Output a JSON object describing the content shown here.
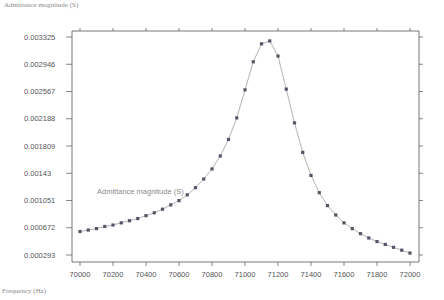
{
  "chart_data": {
    "type": "line",
    "title": "",
    "xlabel": "Frequency (Hz)",
    "ylabel": "Admittance magnitude (S)",
    "xlim": [
      70000,
      72000
    ],
    "ylim": [
      0.000293,
      0.003325
    ],
    "x_ticks": [
      70000,
      70200,
      70400,
      70600,
      70800,
      71000,
      71200,
      71400,
      71600,
      71800,
      72000
    ],
    "y_ticks": [
      "0.003325",
      "0.002946",
      "0.002567",
      "0.002188",
      "0.001809",
      "0.00143",
      "0.001051",
      "0.000672",
      "0.000293"
    ],
    "grid": false,
    "legend": {
      "position": "inline",
      "entries": [
        "Admittance magnitude (S)"
      ]
    },
    "series": [
      {
        "name": "Admittance magnitude (S)",
        "marker": "square",
        "x": [
          70000,
          70050,
          70100,
          70150,
          70200,
          70250,
          70300,
          70350,
          70400,
          70450,
          70500,
          70550,
          70600,
          70650,
          70700,
          70750,
          70800,
          70850,
          70900,
          70950,
          71000,
          71050,
          71100,
          71150,
          71200,
          71250,
          71300,
          71350,
          71400,
          71450,
          71500,
          71550,
          71600,
          71650,
          71700,
          71750,
          71800,
          71850,
          71900,
          71950,
          72000
        ],
        "y": [
          0.00062,
          0.00064,
          0.00066,
          0.00069,
          0.00071,
          0.00074,
          0.00077,
          0.0008,
          0.00084,
          0.00088,
          0.00093,
          0.00099,
          0.00105,
          0.00113,
          0.00123,
          0.00135,
          0.00149,
          0.00167,
          0.0019,
          0.0022,
          0.00259,
          0.00298,
          0.00323,
          0.00327,
          0.00306,
          0.0026,
          0.00213,
          0.00172,
          0.0014,
          0.00116,
          0.00098,
          0.00085,
          0.00074,
          0.00066,
          0.00059,
          0.00053,
          0.00048,
          0.00044,
          0.0004,
          0.00036,
          0.00032
        ]
      }
    ]
  },
  "labels": {
    "y_axis_title": "Admittance magnitude (S)",
    "x_axis_title": "Frequency (Hz)",
    "series_label": "Admittance magnitude (S)"
  },
  "colors": {
    "axis": "#555555",
    "line": "#aaaaaa",
    "marker": "#555566",
    "text": "#555555"
  }
}
